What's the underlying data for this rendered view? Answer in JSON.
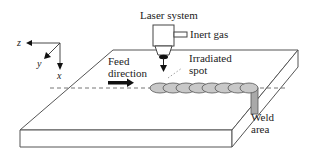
{
  "diagram": {
    "type": "laser-welding-schematic",
    "labels": {
      "laser_system": "Laser system",
      "inert_gas": "Inert gas",
      "irradiated_spot_line1": "Irradiated",
      "irradiated_spot_line2": "spot",
      "feed_direction_line1": "Feed",
      "feed_direction_line2": "direction",
      "weld_area_line1": "Weld",
      "weld_area_line2": "area"
    },
    "axes": {
      "x": "x",
      "y": "y",
      "z": "z"
    },
    "colors": {
      "line": "#555555",
      "bead_fill": "#c8c8c8",
      "weld_area_fill": "#a9a9a9",
      "spot": "#111111",
      "background": "#ffffff"
    },
    "weld_bead_count": 8
  }
}
